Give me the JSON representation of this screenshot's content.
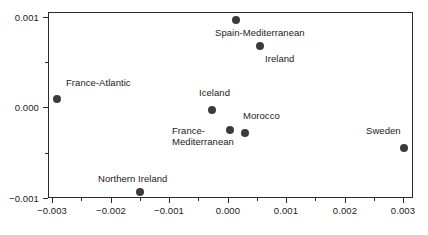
{
  "chart_data": {
    "type": "scatter",
    "title": "",
    "xlabel": "",
    "ylabel": "",
    "xlim": [
      -0.0035,
      0.0035
    ],
    "ylim": [
      -0.001,
      0.00105
    ],
    "grid": false,
    "legend": null,
    "marker_color": "#3b3b3b",
    "frame_color": "#2b2b2b",
    "xticks": [
      {
        "value": -0.003,
        "label": "−0.003",
        "px": 52
      },
      {
        "value": -0.002,
        "label": "−0.002",
        "px": 111
      },
      {
        "value": -0.001,
        "label": "−0.001",
        "px": 169
      },
      {
        "value": 0.0,
        "label": "0.000",
        "px": 228
      },
      {
        "value": 0.001,
        "label": "0.001",
        "px": 286
      },
      {
        "value": 0.002,
        "label": "0.002",
        "px": 345
      },
      {
        "value": 0.003,
        "label": "0.003",
        "px": 403
      }
    ],
    "xticks_minor_px": [
      81,
      140,
      198,
      257,
      315,
      374
    ],
    "yticks": [
      {
        "value": 0.001,
        "label": "0.001",
        "px": 17
      },
      {
        "value": 0.0,
        "label": "0.000",
        "px": 107
      },
      {
        "value": -0.001,
        "label": "−0.001",
        "px": 198
      }
    ],
    "yticks_minor_px": [
      62,
      153
    ],
    "points": [
      {
        "name": "France-Atlantic",
        "x": -0.00292,
        "y": 0.00014,
        "px": 57,
        "py": 99,
        "label": "France-Atlantic",
        "label_px": 66,
        "label_py": 78,
        "label_align": "left"
      },
      {
        "name": "Spain-Mediterranean",
        "x": 0.00013,
        "y": 0.00099,
        "px": 236,
        "py": 20,
        "label": "Spain-Mediterranean",
        "label_px": 215,
        "label_py": 28,
        "label_align": "left"
      },
      {
        "name": "Ireland",
        "x": 0.00055,
        "y": 0.0007,
        "px": 260,
        "py": 46,
        "label": "Ireland",
        "label_px": 265,
        "label_py": 54,
        "label_align": "left"
      },
      {
        "name": "Iceland",
        "x": -0.00027,
        "y": 3e-05,
        "px": 212,
        "py": 110,
        "label": "Iceland",
        "label_px": 199,
        "label_py": 88,
        "label_align": "left"
      },
      {
        "name": "France-Mediterranean",
        "x": 4e-05,
        "y": -0.00025,
        "px": 230,
        "py": 130,
        "label": "France-\nMediterranean",
        "label_px": 172,
        "label_py": 126,
        "label_align": "left"
      },
      {
        "name": "Morocco",
        "x": 0.00029,
        "y": -0.00029,
        "px": 245,
        "py": 133,
        "label": "Morocco",
        "label_px": 243,
        "label_py": 111,
        "label_align": "left"
      },
      {
        "name": "Sweden",
        "x": 0.003,
        "y": -0.00045,
        "px": 404,
        "py": 148,
        "label": "Sweden",
        "label_px": 366,
        "label_py": 126,
        "label_align": "left"
      },
      {
        "name": "Northern Ireland",
        "x": -0.0015,
        "y": -0.00093,
        "px": 140,
        "py": 192,
        "label": "Northern Ireland",
        "label_px": 98,
        "label_py": 174,
        "label_align": "left"
      }
    ]
  }
}
